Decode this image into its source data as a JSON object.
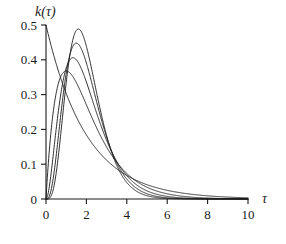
{
  "chart_data": {
    "type": "line",
    "title": "",
    "xlabel": "τ",
    "ylabel": "k(τ)",
    "xlim": [
      0,
      10
    ],
    "ylim": [
      0,
      0.5
    ],
    "grid": false,
    "legend": "none",
    "xticks": [
      "0",
      "2",
      "4",
      "6",
      "8",
      "10"
    ],
    "xtick_values": [
      0,
      2,
      4,
      6,
      8,
      10
    ],
    "yticks": [
      "0",
      "0.1",
      "0.2",
      "0.3",
      "0.4",
      "0.5"
    ],
    "ytick_values": [
      0,
      0.1,
      0.2,
      0.3,
      0.4,
      0.5
    ],
    "common_mean": 2,
    "crossing_point": {
      "tau": 0.9,
      "k": 0.37
    },
    "series": [
      {
        "name": "n = 1",
        "shape": 1,
        "rate": 0.5,
        "peak": {
          "tau": 0.0,
          "k": 0.5
        },
        "x": [
          0,
          0.25,
          0.5,
          0.75,
          1,
          1.5,
          2,
          2.5,
          3,
          3.5,
          4,
          4.5,
          5,
          6,
          7,
          8,
          9,
          10
        ],
        "values": [
          0.5,
          0.441,
          0.389,
          0.344,
          0.303,
          0.236,
          0.184,
          0.143,
          0.112,
          0.087,
          0.068,
          0.053,
          0.041,
          0.025,
          0.015,
          0.009,
          0.006,
          0.003
        ]
      },
      {
        "name": "n = 2",
        "shape": 2,
        "rate": 1.0,
        "peak": {
          "tau": 1.0,
          "k": 0.368
        },
        "x": [
          0,
          0.25,
          0.5,
          0.75,
          1,
          1.5,
          2,
          2.5,
          3,
          3.5,
          4,
          4.5,
          5,
          6,
          7,
          8,
          9,
          10
        ],
        "values": [
          0,
          0.195,
          0.303,
          0.354,
          0.368,
          0.335,
          0.271,
          0.205,
          0.149,
          0.106,
          0.073,
          0.05,
          0.034,
          0.015,
          0.006,
          0.003,
          0.001,
          0.0005
        ]
      },
      {
        "name": "n = 3",
        "shape": 3,
        "rate": 1.5,
        "peak": {
          "tau": 1.333,
          "k": 0.406
        },
        "x": [
          0,
          0.25,
          0.5,
          0.75,
          1,
          1.5,
          2,
          2.5,
          3,
          3.5,
          4,
          4.5,
          5,
          6,
          7,
          8,
          9,
          10
        ],
        "values": [
          0,
          0.072,
          0.199,
          0.307,
          0.377,
          0.406,
          0.336,
          0.244,
          0.167,
          0.109,
          0.069,
          0.043,
          0.026,
          0.009,
          0.003,
          0.001,
          0.0003,
          0.0001
        ]
      },
      {
        "name": "n = 4",
        "shape": 4,
        "rate": 2.0,
        "peak": {
          "tau": 1.5,
          "k": 0.446
        },
        "x": [
          0,
          0.25,
          0.5,
          0.75,
          1,
          1.5,
          2,
          2.5,
          3,
          3.5,
          4,
          4.5,
          5,
          6,
          7,
          8,
          9,
          10
        ],
        "values": [
          0,
          0.025,
          0.123,
          0.251,
          0.361,
          0.446,
          0.391,
          0.281,
          0.179,
          0.105,
          0.058,
          0.031,
          0.016,
          0.004,
          0.001,
          0.0002,
          5e-05,
          1e-05
        ]
      },
      {
        "name": "n = 5",
        "shape": 5,
        "rate": 2.5,
        "peak": {
          "tau": 1.6,
          "k": 0.489
        },
        "x": [
          0,
          0.25,
          0.5,
          0.75,
          1,
          1.5,
          2,
          2.5,
          3,
          3.5,
          4,
          4.5,
          5,
          6,
          7,
          8,
          9,
          10
        ],
        "values": [
          0,
          0.008,
          0.07,
          0.195,
          0.334,
          0.483,
          0.439,
          0.306,
          0.181,
          0.095,
          0.046,
          0.021,
          0.009,
          0.001,
          0.0002,
          3e-05,
          4e-06,
          5e-07
        ]
      }
    ]
  }
}
